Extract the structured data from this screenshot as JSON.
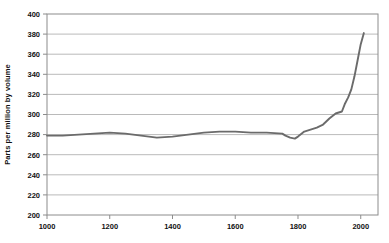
{
  "chart_data": {
    "type": "line",
    "title": "",
    "xlabel": "",
    "ylabel": "Parts per million by volume",
    "xlim": [
      1000,
      2055
    ],
    "ylim": [
      200,
      400
    ],
    "xticks": [
      1000,
      1200,
      1400,
      1600,
      1800,
      2000
    ],
    "yticks": [
      200,
      220,
      240,
      260,
      280,
      300,
      320,
      340,
      360,
      380,
      400
    ],
    "grid": true,
    "legend": "none",
    "series": [
      {
        "name": "Carbon dioxide concentration",
        "color": "#6b6b6b",
        "x": [
          1000,
          1050,
          1100,
          1150,
          1200,
          1250,
          1300,
          1350,
          1400,
          1450,
          1500,
          1550,
          1600,
          1650,
          1700,
          1750,
          1760,
          1775,
          1790,
          1800,
          1820,
          1840,
          1860,
          1880,
          1900,
          1920,
          1940,
          1950,
          1960,
          1970,
          1980,
          1990,
          2000,
          2010
        ],
        "y": [
          279,
          279,
          280,
          281,
          282,
          281,
          279,
          277,
          278,
          280,
          282,
          283,
          283,
          282,
          282,
          281,
          279,
          277,
          276,
          278,
          283,
          285,
          287,
          290,
          296,
          301,
          303,
          311,
          317,
          325,
          338,
          354,
          370,
          381
        ]
      }
    ]
  },
  "axes": {
    "y_title": "Parts per million by volume",
    "x_tick_labels": [
      "1000",
      "1200",
      "1400",
      "1600",
      "1800",
      "2000"
    ],
    "y_tick_labels": [
      "400",
      "380",
      "360",
      "340",
      "320",
      "300",
      "280",
      "260",
      "240",
      "220",
      "200"
    ]
  },
  "colors": {
    "line": "#6b6b6b",
    "grid": "#a8a8a8",
    "frame": "#8c8c8c",
    "text": "#111111"
  }
}
